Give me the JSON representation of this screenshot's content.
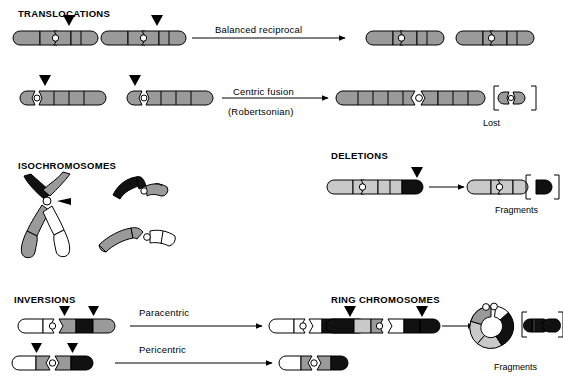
{
  "figure": {
    "title_visible": false,
    "background": "#ffffff",
    "colors": {
      "grey_band": "#9a9a9a",
      "light_grey_band": "#c9c9c9",
      "black_band": "#111111",
      "white_band": "#ffffff",
      "outline": "#000000"
    }
  },
  "sections": {
    "translocations": {
      "title": "TRANSLOCATIONS",
      "rows": [
        {
          "id": "balanced-reciprocal",
          "arrow_label": "Balanced reciprocal",
          "arrow_label_line2": "",
          "markers": 2,
          "inputs": 2,
          "outputs": 2
        },
        {
          "id": "centric-fusion",
          "arrow_label": "Centric fusion",
          "arrow_label_line2": "(Robertsonian)",
          "markers": 2,
          "inputs": 2,
          "outputs": 1,
          "byproduct_caption": "Lost"
        }
      ]
    },
    "isochromosomes": {
      "title": "ISOCHROMOSOMES",
      "has_metaphase_x": true,
      "derivative_count": 2
    },
    "deletions": {
      "title": "DELETIONS",
      "markers": 1,
      "byproduct_caption": "Fragments"
    },
    "inversions": {
      "title": "INVERSIONS",
      "rows": [
        {
          "id": "paracentric",
          "arrow_label": "Paracentric",
          "markers": 2
        },
        {
          "id": "pericentric",
          "arrow_label": "Pericentric",
          "markers": 2
        }
      ]
    },
    "ring_chromosomes": {
      "title": "RING CHROMOSOMES",
      "markers": 2,
      "byproduct_caption": "Fragments",
      "fragment_count": 2
    }
  },
  "captions": {
    "lost": "Lost",
    "fragments_deletion": "Fragments",
    "fragments_ring": "Fragments"
  },
  "arrow_labels": {
    "balanced_reciprocal": "Balanced reciprocal",
    "centric_fusion": "Centric fusion",
    "robertsonian": "(Robertsonian)",
    "paracentric": "Paracentric",
    "pericentric": "Pericentric"
  }
}
